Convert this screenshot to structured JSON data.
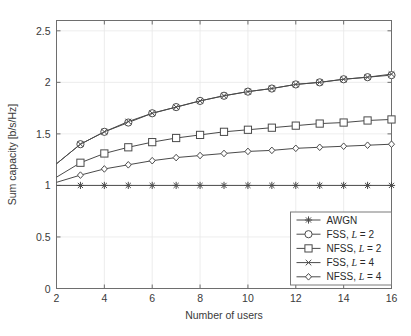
{
  "chart_data": {
    "type": "line",
    "title": "",
    "xlabel": "Number of users",
    "ylabel": "Sum capacity [b/s/Hz]",
    "xlim": [
      2,
      16
    ],
    "ylim": [
      0,
      2.6
    ],
    "xticks": [
      2,
      4,
      6,
      8,
      10,
      12,
      14,
      16
    ],
    "xticklabels": [
      "2",
      "4",
      "6",
      "8",
      "10",
      "12",
      "14",
      "16"
    ],
    "yticks": [
      0,
      0.5,
      1,
      1.5,
      2,
      2.5
    ],
    "yticklabels": [
      "0",
      "0.5",
      "1",
      "1.5",
      "2",
      "2.5"
    ],
    "grid": true,
    "legend_position": "lower right",
    "x": [
      2,
      3,
      4,
      5,
      6,
      7,
      8,
      9,
      10,
      11,
      12,
      13,
      14,
      15,
      16
    ],
    "series": [
      {
        "name": "AWGN",
        "label_prefix": "AWGN",
        "label_italic": "",
        "label_suffix": "",
        "marker": "asterisk",
        "values": [
          1.0,
          1.0,
          1.0,
          1.0,
          1.0,
          1.0,
          1.0,
          1.0,
          1.0,
          1.0,
          1.0,
          1.0,
          1.0,
          1.0,
          1.0
        ]
      },
      {
        "name": "FSS, L = 2",
        "label_prefix": "FSS, ",
        "label_italic": "L",
        "label_suffix": " = 2",
        "marker": "circle",
        "values": [
          1.21,
          1.4,
          1.52,
          1.61,
          1.7,
          1.76,
          1.82,
          1.87,
          1.91,
          1.94,
          1.98,
          2.0,
          2.03,
          2.05,
          2.07
        ]
      },
      {
        "name": "NFSS, L = 2",
        "label_prefix": "NFSS, ",
        "label_italic": "L",
        "label_suffix": " = 2",
        "marker": "square",
        "values": [
          1.08,
          1.22,
          1.31,
          1.37,
          1.42,
          1.46,
          1.49,
          1.52,
          1.54,
          1.56,
          1.58,
          1.6,
          1.61,
          1.63,
          1.64
        ]
      },
      {
        "name": "FSS, L = 4",
        "label_prefix": "FSS, ",
        "label_italic": "L",
        "label_suffix": " = 4",
        "marker": "x",
        "values": [
          1.21,
          1.4,
          1.52,
          1.62,
          1.7,
          1.76,
          1.82,
          1.87,
          1.91,
          1.94,
          1.98,
          2.0,
          2.03,
          2.05,
          2.08
        ]
      },
      {
        "name": "NFSS, L = 4",
        "label_prefix": "NFSS, ",
        "label_italic": "L",
        "label_suffix": " = 4",
        "marker": "diamond",
        "values": [
          1.03,
          1.1,
          1.16,
          1.2,
          1.24,
          1.27,
          1.29,
          1.31,
          1.33,
          1.34,
          1.36,
          1.37,
          1.38,
          1.39,
          1.4
        ]
      }
    ]
  },
  "colors": {
    "line": "#4a4a4a",
    "axis": "#6e6e6e",
    "grid": "#e8e8e8",
    "background": "#ffffff",
    "text": "#2a2a2a"
  }
}
